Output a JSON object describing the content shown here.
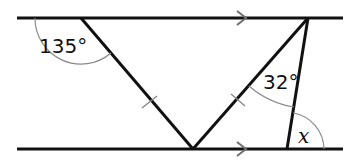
{
  "diagram": {
    "type": "geometry-parallel-lines",
    "labels": {
      "angle_top_left": "135°",
      "angle_top_right": "32°",
      "angle_unknown": "x"
    },
    "points": {
      "top_left": [
        81,
        18
      ],
      "top_right": [
        308,
        18
      ],
      "bottom_mid": [
        193,
        149
      ],
      "bottom_right": [
        287,
        149
      ]
    },
    "markings": {
      "parallel_arrows": 2,
      "equal_length_ticks": 2
    },
    "colors": {
      "line": "#111111",
      "arc": "#8a8a8a",
      "tick": "#8a8a8a",
      "arrow": "#6f6f6f"
    }
  }
}
